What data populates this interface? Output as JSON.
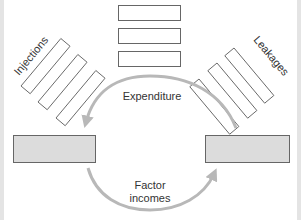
{
  "diagram": {
    "labels": {
      "injections": "Injections",
      "leakages": "Leakages",
      "expenditure": "Expenditure",
      "factor_incomes_line1": "Factor",
      "factor_incomes_line2": "incomes"
    },
    "colors": {
      "background": "#ffffff",
      "edge_strip": "#e4e4e4",
      "box_outline": "#666666",
      "sector_box_fill": "#dcdcdc",
      "arrow": "#b8b8b8",
      "text": "#333333"
    },
    "boxes": {
      "top_stack_count": 3,
      "injections_count": 3,
      "leakages_count": 3,
      "sectors": [
        "left-sector-box",
        "right-sector-box"
      ]
    },
    "flows": [
      {
        "name": "Expenditure",
        "from": "right-sector-box",
        "to": "left-sector-box",
        "path": "upper arc"
      },
      {
        "name": "Factor incomes",
        "from": "left-sector-box",
        "to": "right-sector-box",
        "path": "lower arc"
      }
    ]
  }
}
